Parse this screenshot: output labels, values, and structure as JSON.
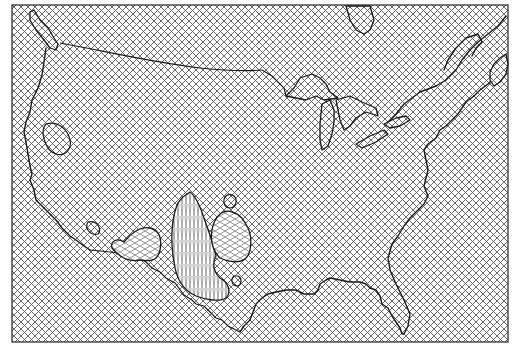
{
  "map": {
    "title": "United States contour map",
    "width": 515,
    "height": 347,
    "background_pattern": "crosshatch",
    "line_color": "#1a1a1a",
    "hatch_color": "#555555",
    "background_color": "#ffffff",
    "regions": [
      {
        "id": "southwest-high",
        "label": "",
        "pattern": "vertical-hatch"
      },
      {
        "id": "southwest-medium",
        "label": "",
        "pattern": "diagonal-hatch"
      },
      {
        "id": "great-basin-island",
        "label": "",
        "pattern": "crosshatch"
      }
    ],
    "features": [
      "us-coastline",
      "great-lakes",
      "canada-border",
      "mexico-border",
      "florida",
      "gulf-coast",
      "atlantic-coast",
      "pacific-coast"
    ]
  }
}
